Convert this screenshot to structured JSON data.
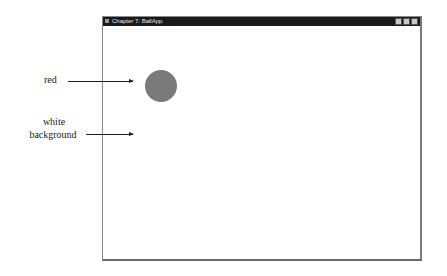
{
  "window": {
    "title": "Chapter 7: BallApp",
    "buttons": [
      "minimize",
      "maximize",
      "close"
    ],
    "background_color": "#ffffff"
  },
  "ball": {
    "color": "#7a7a7a",
    "center_x": 58,
    "center_y": 60,
    "diameter": 32
  },
  "annotations": {
    "ball_label": "red",
    "background_label_line1": "white",
    "background_label_line2": "background"
  }
}
